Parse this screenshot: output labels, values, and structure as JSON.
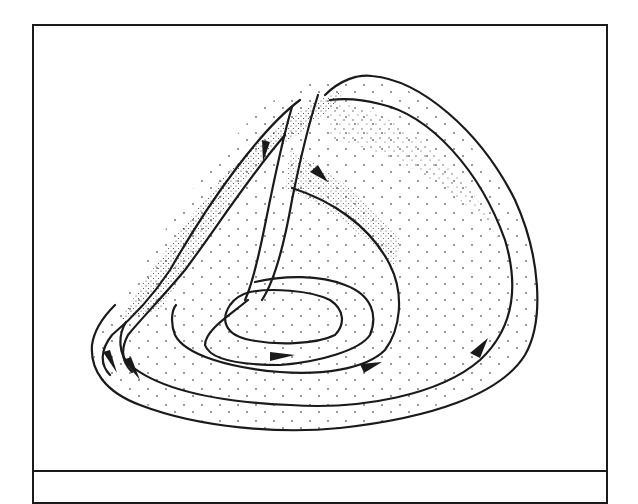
{
  "figure": {
    "kind": "line-drawing",
    "colors": {
      "ink": "#1a1a1a",
      "background": "#ffffff"
    },
    "arrows": [
      {
        "id": "arrow-down-left-strand",
        "direction": "down"
      },
      {
        "id": "arrow-up-inner-surface",
        "direction": "up-left"
      },
      {
        "id": "arrow-inner-loop",
        "direction": "right"
      },
      {
        "id": "arrow-middle-loop",
        "direction": "right"
      },
      {
        "id": "arrow-outer-right",
        "direction": "up-right"
      },
      {
        "id": "arrow-outer-left-1",
        "direction": "down-right"
      },
      {
        "id": "arrow-outer-left-2",
        "direction": "down-right"
      }
    ],
    "caption_area": {
      "text": ""
    }
  }
}
